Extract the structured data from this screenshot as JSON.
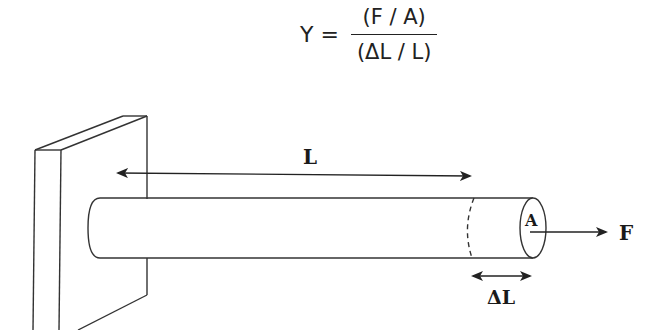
{
  "formula": {
    "lhs": "Y =",
    "numerator": "(F / A)",
    "denominator": "(ΔL / L)"
  },
  "diagram": {
    "length_label": "L",
    "area_label": "A",
    "force_label": "F",
    "extension_label": "ΔL",
    "stroke_color": "#222222",
    "background": "#ffffff"
  }
}
